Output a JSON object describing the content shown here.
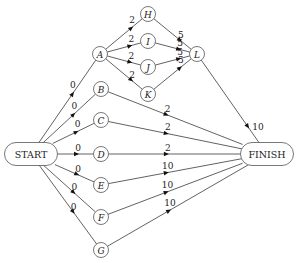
{
  "diagram": {
    "type": "activity-network",
    "terminals": {
      "start": {
        "label": "START",
        "x": 31,
        "y": 154
      },
      "finish": {
        "label": "FINISH",
        "x": 267,
        "y": 154
      }
    },
    "nodes": [
      {
        "id": "A",
        "label": "A",
        "x": 100,
        "y": 54
      },
      {
        "id": "B",
        "label": "B",
        "x": 101,
        "y": 89
      },
      {
        "id": "C",
        "label": "C",
        "x": 101,
        "y": 120
      },
      {
        "id": "D",
        "label": "D",
        "x": 101,
        "y": 154
      },
      {
        "id": "E",
        "label": "E",
        "x": 101,
        "y": 185
      },
      {
        "id": "F",
        "label": "F",
        "x": 101,
        "y": 217
      },
      {
        "id": "G",
        "label": "G",
        "x": 101,
        "y": 250
      },
      {
        "id": "H",
        "label": "H",
        "x": 148,
        "y": 14
      },
      {
        "id": "I",
        "label": "I",
        "x": 148,
        "y": 41
      },
      {
        "id": "J",
        "label": "J",
        "x": 148,
        "y": 67
      },
      {
        "id": "K",
        "label": "K",
        "x": 148,
        "y": 94
      },
      {
        "id": "L",
        "label": "L",
        "x": 197,
        "y": 54
      }
    ],
    "edges": [
      {
        "from": "START",
        "to": "A",
        "weight": "0"
      },
      {
        "from": "START",
        "to": "B",
        "weight": "0"
      },
      {
        "from": "START",
        "to": "C",
        "weight": "0"
      },
      {
        "from": "START",
        "to": "D",
        "weight": "0"
      },
      {
        "from": "START",
        "to": "E",
        "weight": "0"
      },
      {
        "from": "START",
        "to": "F",
        "weight": "0"
      },
      {
        "from": "START",
        "to": "G",
        "weight": "0"
      },
      {
        "from": "A",
        "to": "H",
        "weight": "2"
      },
      {
        "from": "A",
        "to": "I",
        "weight": "2"
      },
      {
        "from": "A",
        "to": "J",
        "weight": "2"
      },
      {
        "from": "A",
        "to": "K",
        "weight": "2"
      },
      {
        "from": "H",
        "to": "L",
        "weight": "5"
      },
      {
        "from": "I",
        "to": "L",
        "weight": "5"
      },
      {
        "from": "J",
        "to": "L",
        "weight": "5"
      },
      {
        "from": "K",
        "to": "L",
        "weight": "5"
      },
      {
        "from": "L",
        "to": "FINISH",
        "weight": "10"
      },
      {
        "from": "B",
        "to": "FINISH",
        "weight": "2"
      },
      {
        "from": "C",
        "to": "FINISH",
        "weight": "2"
      },
      {
        "from": "D",
        "to": "FINISH",
        "weight": "2"
      },
      {
        "from": "E",
        "to": "FINISH",
        "weight": "10"
      },
      {
        "from": "F",
        "to": "FINISH",
        "weight": "10"
      },
      {
        "from": "G",
        "to": "FINISH",
        "weight": "10"
      }
    ]
  }
}
